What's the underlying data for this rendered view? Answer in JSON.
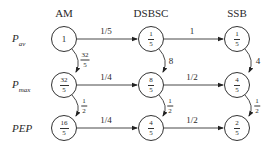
{
  "columns": [
    {
      "id": "am",
      "label": "AM",
      "x": 64
    },
    {
      "id": "dsbsc",
      "label": "DSBSC",
      "x": 151
    },
    {
      "id": "ssb",
      "label": "SSB",
      "x": 237
    }
  ],
  "rows": [
    {
      "id": "pav",
      "label_main": "P",
      "label_sub": "av",
      "y": 39
    },
    {
      "id": "pmax",
      "label_main": "P",
      "label_sub": "max",
      "y": 85
    },
    {
      "id": "pep",
      "label_main": "PEP",
      "label_sub": "",
      "y": 128
    }
  ],
  "nodes": {
    "am_pav": {
      "type": "whole",
      "value": "1"
    },
    "am_pmax": {
      "type": "frac",
      "num": "32",
      "den": "5"
    },
    "am_pep": {
      "type": "frac",
      "num": "16",
      "den": "5"
    },
    "dsbsc_pav": {
      "type": "frac",
      "num": "1",
      "den": "5"
    },
    "dsbsc_pmax": {
      "type": "frac",
      "num": "8",
      "den": "5"
    },
    "dsbsc_pep": {
      "type": "frac",
      "num": "4",
      "den": "5"
    },
    "ssb_pav": {
      "type": "frac",
      "num": "1",
      "den": "5"
    },
    "ssb_pmax": {
      "type": "frac",
      "num": "4",
      "den": "5"
    },
    "ssb_pep": {
      "type": "frac",
      "num": "2",
      "den": "5"
    }
  },
  "horizontal_edges": {
    "am_dsbsc_pav": "1/5",
    "dsbsc_ssb_pav": "1",
    "am_dsbsc_pmax": "1/4",
    "dsbsc_ssb_pmax": "1/2",
    "am_dsbsc_pep": "1/4",
    "dsbsc_ssb_pep": "1/2"
  },
  "vertical_edges": {
    "am_pav_pmax": {
      "num": "32",
      "den": "5"
    },
    "am_pmax_pep": {
      "num": "1",
      "den": "2"
    },
    "dsbsc_pav_pmax": "8",
    "dsbsc_pmax_pep": {
      "num": "1",
      "den": "2"
    },
    "ssb_pav_pmax": "4",
    "ssb_pmax_pep": {
      "num": "1",
      "den": "2"
    }
  }
}
